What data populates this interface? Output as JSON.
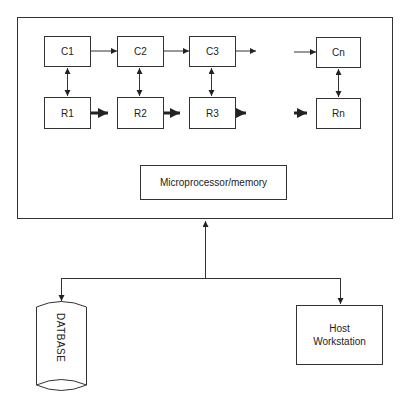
{
  "diagram": {
    "title_fragment": "",
    "system_box": {
      "cells_top": [
        {
          "id": "c1",
          "label": "C1"
        },
        {
          "id": "c2",
          "label": "C2"
        },
        {
          "id": "c3",
          "label": "C3"
        },
        {
          "id": "cn",
          "label": "Cn"
        }
      ],
      "cells_bottom": [
        {
          "id": "r1",
          "label": "R1"
        },
        {
          "id": "r2",
          "label": "R2"
        },
        {
          "id": "r3",
          "label": "R3"
        },
        {
          "id": "rn",
          "label": "Rn"
        }
      ],
      "processor": {
        "label": "Microprocessor/memory"
      }
    },
    "database": {
      "label": "DATBASE"
    },
    "host": {
      "label_line1": "Host",
      "label_line2": "Workstation"
    },
    "colors": {
      "stroke": "#333333",
      "background": "#ffffff"
    }
  }
}
